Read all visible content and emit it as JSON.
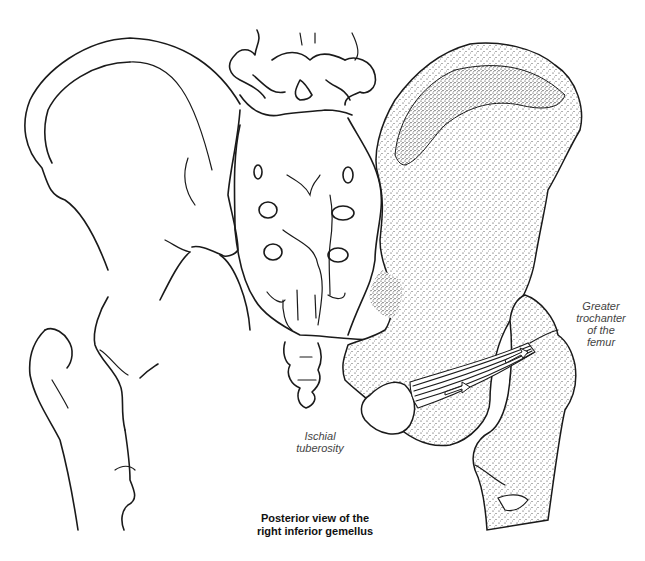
{
  "figure": {
    "title_line1": "Posterior view of the",
    "title_line2": "right inferior gemellus",
    "view": "posterior",
    "muscle": "inferior gemellus (right)"
  },
  "labels": {
    "greater_trochanter": {
      "line1": "Greater",
      "line2": "trochanter",
      "line3": "of the",
      "line4": "femur"
    },
    "ischial_tuberosity": {
      "line1": "Ischial",
      "line2": "tuberosity"
    }
  },
  "structures": [
    "left-ilium-outline",
    "lumbar-vertebrae",
    "sacrum",
    "coccyx",
    "left-femur-outline",
    "right-ilium-stippled",
    "right-femur-stippled",
    "inferior-gemellus-muscle"
  ],
  "colors": {
    "line": "#1a1a1a",
    "stipple": "#2a2a2a",
    "label_text": "#444444",
    "caption_text": "#111111",
    "background": "#ffffff"
  }
}
